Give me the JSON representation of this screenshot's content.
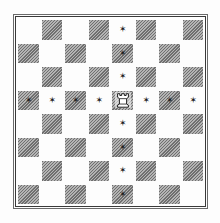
{
  "diagram": {
    "type": "chessboard",
    "size": 8,
    "top_left_square_color": "light",
    "colors": {
      "light_square": "#fdfdfd",
      "dark_square_hatch": "#8c8c8c",
      "border": "#3a3a3a",
      "marker": "#1e1e1e"
    },
    "piece": {
      "type": "rook",
      "color": "white",
      "square": "e5",
      "row": 3,
      "col": 4,
      "glyph": "♖"
    },
    "marker_glyph": "✶",
    "markers": [
      {
        "square": "e8",
        "row": 0,
        "col": 4
      },
      {
        "square": "e7",
        "row": 1,
        "col": 4
      },
      {
        "square": "e6",
        "row": 2,
        "col": 4
      },
      {
        "square": "a5",
        "row": 3,
        "col": 0
      },
      {
        "square": "b5",
        "row": 3,
        "col": 1
      },
      {
        "square": "c5",
        "row": 3,
        "col": 2
      },
      {
        "square": "d5",
        "row": 3,
        "col": 3
      },
      {
        "square": "f5",
        "row": 3,
        "col": 5
      },
      {
        "square": "g5",
        "row": 3,
        "col": 6
      },
      {
        "square": "h5",
        "row": 3,
        "col": 7
      },
      {
        "square": "e4",
        "row": 4,
        "col": 4
      },
      {
        "square": "e3",
        "row": 5,
        "col": 4
      },
      {
        "square": "e2",
        "row": 6,
        "col": 4
      },
      {
        "square": "e1",
        "row": 7,
        "col": 4
      }
    ]
  }
}
